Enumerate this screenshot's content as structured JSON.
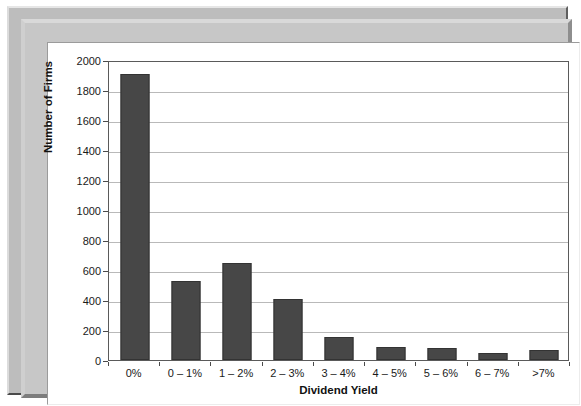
{
  "chart_data": {
    "type": "bar",
    "title": "",
    "xlabel": "Dividend Yield",
    "ylabel": "Number of Firms",
    "categories": [
      "0%",
      "0 – 1%",
      "1 – 2%",
      "2 – 3%",
      "3 – 4%",
      "4 – 5%",
      "5 – 6%",
      "6 – 7%",
      ">7%"
    ],
    "values": [
      1910,
      530,
      650,
      410,
      155,
      85,
      80,
      45,
      70
    ],
    "ylim": [
      0,
      2000
    ],
    "yticks": [
      0,
      200,
      400,
      600,
      800,
      1000,
      1200,
      1400,
      1600,
      1800,
      2000
    ],
    "ytick_labels": [
      "0",
      "200",
      "400",
      "600",
      "800",
      "1000",
      "1200",
      "1400",
      "1600",
      "1800",
      "2000"
    ],
    "grid": true,
    "legend": false,
    "bar_color": "#474747",
    "gridline_color": "#b9b9b9",
    "axis_color": "#5a5a5a",
    "plot_background": "#ffffff",
    "frame_color": "#c7c7c7"
  }
}
